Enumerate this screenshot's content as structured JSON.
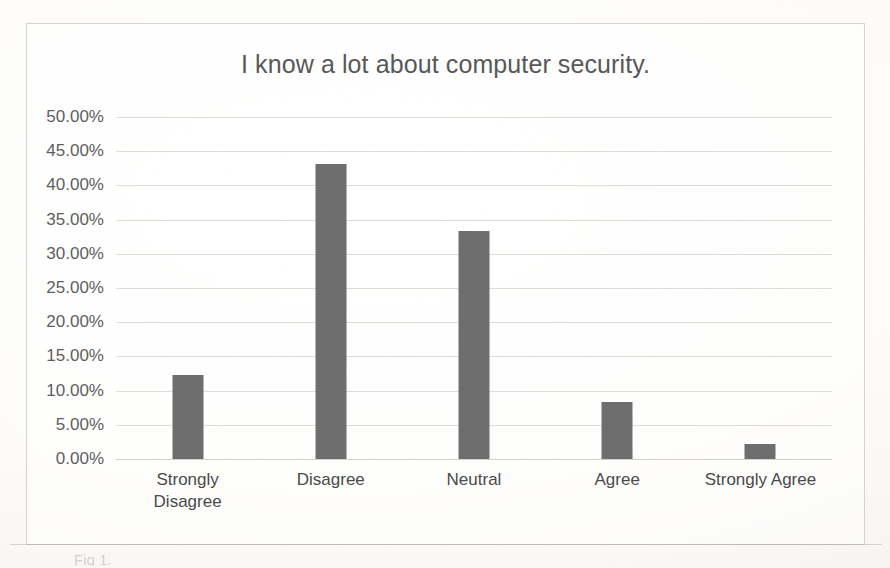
{
  "figure": {
    "caption": "Fig 1."
  },
  "chart_data": {
    "type": "bar",
    "title": "I know a lot about computer security.",
    "xlabel": "",
    "ylabel": "",
    "categories": [
      "Strongly\nDisagree",
      "Disagree",
      "Neutral",
      "Agree",
      "Strongly Agree"
    ],
    "values": [
      12.3,
      43.2,
      33.3,
      8.3,
      2.2
    ],
    "value_unit": "%",
    "ylim": [
      0,
      50
    ],
    "ytick_values": [
      50,
      45,
      40,
      35,
      30,
      25,
      20,
      15,
      10,
      5,
      0
    ],
    "ytick_labels": [
      "50.00%",
      "45.00%",
      "40.00%",
      "35.00%",
      "30.00%",
      "25.00%",
      "20.00%",
      "15.00%",
      "10.00%",
      "5.00%",
      "0.00%"
    ],
    "grid": true,
    "legend": false,
    "bar_color": "#6e6e6e",
    "gridline_color": "#dedcd8",
    "title_color": "#585858",
    "tick_color": "#5e5e5e",
    "plot_background": "#ffffff"
  }
}
